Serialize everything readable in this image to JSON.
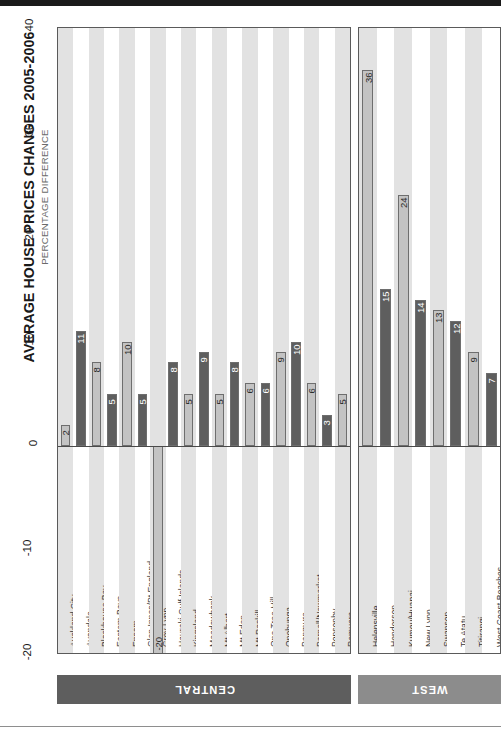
{
  "chart_data": {
    "type": "bar",
    "title": "AVERAGE HOUSE PRICES CHANGES 2005-2006",
    "subtitle": "PERCENTAGE DIFFERENCE",
    "xlabel": "",
    "ylabel": "PERCENTAGE DIFFERENCE",
    "ylim": [
      -20,
      40
    ],
    "orientation": "vertical-rotated-90",
    "grid": true,
    "legend": "none",
    "tick_labels": [
      "-20",
      "-10",
      "0",
      "10",
      "20",
      "30",
      "40"
    ],
    "ticks": [
      -20,
      -10,
      0,
      10,
      20,
      30,
      40
    ],
    "groups": [
      {
        "name": "CENTRAL",
        "categories": [
          "Auckland City",
          "Avondale",
          "Blockhouse Bay",
          "Eastern Bays",
          "Epsom",
          "Glen Innes/Pt England",
          "Grey Lynn",
          "Hauraki Gulf Islands",
          "Kingsland",
          "Meadowbank",
          "Mt Albert",
          "Mt Eden",
          "Mt Roskill",
          "One Tree Hill",
          "Onehunga",
          "Panmure",
          "Parnell/Newmarket",
          "Ponsonby",
          "Remuera"
        ],
        "values": [
          2,
          11,
          8,
          5,
          10,
          5,
          -20,
          8,
          5,
          9,
          5,
          8,
          6,
          6,
          9,
          10,
          6,
          3,
          5
        ]
      },
      {
        "name": "WEST",
        "categories": [
          "Helensville",
          "Henderson",
          "Kumeu/Huapai",
          "New Lynn",
          "Swanson",
          "Te Atatu",
          "Titirangi",
          "West Coast Beaches"
        ],
        "values": [
          36,
          15,
          24,
          14,
          13,
          12,
          9,
          7,
          12
        ]
      }
    ]
  },
  "colors": {
    "bar_light": "#c3c3c3",
    "bar_dark": "#5e5e5e",
    "band_central": "#5e5e5e",
    "band_west": "#8c8c8c",
    "plot_band": "#e2e2e2",
    "title": "#1a1a1a",
    "subtitle": "#6b6b6b"
  }
}
